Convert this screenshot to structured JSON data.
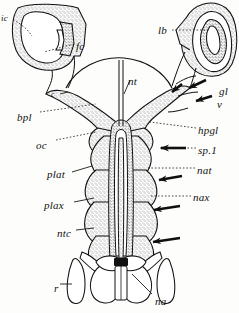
{
  "figure": {
    "ink_color": "#111111",
    "stipple_color": "#6b6b6b",
    "paper_color": "#fdfdfb",
    "width": 239,
    "height": 313
  },
  "labels": [
    {
      "id": "ic",
      "text": "ic",
      "x": 1,
      "y": 14,
      "size": "sm"
    },
    {
      "id": "fc",
      "text": "fc",
      "x": 76,
      "y": 41,
      "size": "md"
    },
    {
      "id": "lb",
      "text": "lb",
      "x": 158,
      "y": 25,
      "size": "md"
    },
    {
      "id": "nt",
      "text": "nt",
      "x": 128,
      "y": 76,
      "size": "md"
    },
    {
      "id": "c",
      "text": "c",
      "x": 51,
      "y": 91,
      "size": "xs"
    },
    {
      "id": "gl",
      "text": "gl",
      "x": 219,
      "y": 86,
      "size": "md"
    },
    {
      "id": "v",
      "text": "v",
      "x": 217,
      "y": 99,
      "size": "md"
    },
    {
      "id": "bpl",
      "text": "bpl",
      "x": 17,
      "y": 112,
      "size": "md"
    },
    {
      "id": "hpgl",
      "text": "hpgl",
      "x": 198,
      "y": 125,
      "size": "md"
    },
    {
      "id": "oc",
      "text": "oc",
      "x": 36,
      "y": 140,
      "size": "md"
    },
    {
      "id": "sp1",
      "text": "sp.1",
      "x": 198,
      "y": 145,
      "size": "md"
    },
    {
      "id": "nat",
      "text": "nat",
      "x": 197,
      "y": 165,
      "size": "md"
    },
    {
      "id": "plat",
      "text": "plat",
      "x": 47,
      "y": 169,
      "size": "md"
    },
    {
      "id": "nax",
      "text": "nax",
      "x": 193,
      "y": 192,
      "size": "md"
    },
    {
      "id": "plax",
      "text": "plax",
      "x": 44,
      "y": 200,
      "size": "md"
    },
    {
      "id": "ntc",
      "text": "ntc",
      "x": 57,
      "y": 228,
      "size": "md"
    },
    {
      "id": "r",
      "text": "r",
      "x": 54,
      "y": 283,
      "size": "md"
    },
    {
      "id": "na",
      "text": "na",
      "x": 155,
      "y": 296,
      "size": "md"
    }
  ],
  "structures": [
    {
      "id": "left-capsule",
      "name": "left otic capsule",
      "label_ref": "ic"
    },
    {
      "id": "fenestra",
      "name": "fenestra cochleae",
      "label_ref": "fc"
    },
    {
      "id": "right-labyrinth",
      "name": "labyrinth",
      "label_ref": "lb"
    },
    {
      "id": "notochord",
      "name": "notochord",
      "label_ref": "nt"
    },
    {
      "id": "basal-plate",
      "name": "basal plate",
      "label_ref": "bpl"
    },
    {
      "id": "occipital-condyle",
      "name": "occipital condyle",
      "label_ref": "oc"
    },
    {
      "id": "glossopharyngeal",
      "name": "glossopharyngeal nerve",
      "label_ref": "gl"
    },
    {
      "id": "vagus",
      "name": "vagus nerve",
      "label_ref": "v"
    },
    {
      "id": "hypoglossal",
      "name": "hypoglossal foramina",
      "label_ref": "hpgl"
    },
    {
      "id": "spinal-nerve-1",
      "name": "first spinal nerve",
      "label_ref": "sp1"
    },
    {
      "id": "neural-arch-atlas",
      "name": "neural arch of atlas",
      "label_ref": "nat"
    },
    {
      "id": "neural-arch-axis",
      "name": "neural arch of axis",
      "label_ref": "nax"
    },
    {
      "id": "pleurocentrum-atlas",
      "name": "pleurocentrum of atlas",
      "label_ref": "plat"
    },
    {
      "id": "pleurocentrum-axis",
      "name": "pleurocentrum of axis",
      "label_ref": "plax"
    },
    {
      "id": "notochordal-canal",
      "name": "notochordal canal",
      "label_ref": "ntc"
    },
    {
      "id": "rib",
      "name": "rib",
      "label_ref": "r"
    },
    {
      "id": "neural-arch",
      "name": "neural arch",
      "label_ref": "na"
    }
  ],
  "arrows": [
    {
      "id": "arrow-gl",
      "points_to": "gl",
      "x": 186,
      "y": 88
    },
    {
      "id": "arrow-v",
      "points_to": "v",
      "x": 192,
      "y": 101
    },
    {
      "id": "arrow-sp1",
      "points_to": "sp.1",
      "x": 158,
      "y": 147
    },
    {
      "id": "arrow-nax",
      "points_to": "nax",
      "x": 158,
      "y": 178
    },
    {
      "id": "arrow-seg3",
      "points_to": "nax",
      "x": 153,
      "y": 208
    },
    {
      "id": "arrow-seg4",
      "points_to": "nax",
      "x": 152,
      "y": 240
    }
  ]
}
